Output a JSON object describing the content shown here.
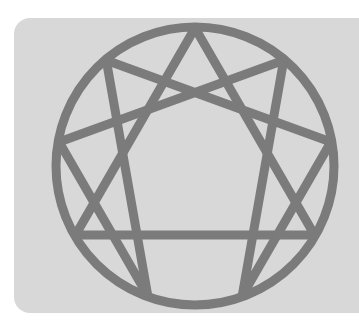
{
  "image": {
    "subject": "enneagram-symbol",
    "colors": {
      "background": "#ffffff",
      "panel": "#d8d8d8",
      "stroke": "#7b7b7b"
    },
    "geometry": {
      "center": [
        195,
        166
      ],
      "radius": 139,
      "stroke_width": 9,
      "triangle": [
        9,
        3,
        6
      ],
      "hexad": [
        1,
        4,
        2,
        8,
        5,
        7
      ]
    }
  }
}
